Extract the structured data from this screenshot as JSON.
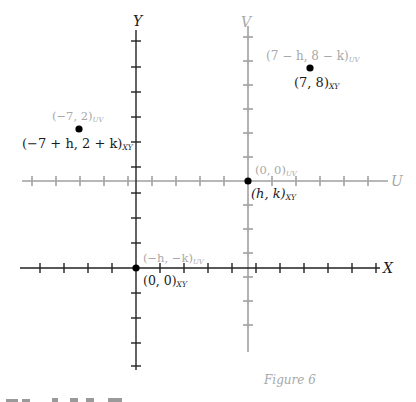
{
  "figure": {
    "caption": "Figure 6",
    "colors": {
      "xy_axes": "#222222",
      "uv_axes": "#a0a0a0",
      "xy_labels": "#1a1a1a",
      "uv_labels": "#a8a8a8",
      "points": "#000000"
    }
  },
  "axes": {
    "xy": {
      "x_label": "X",
      "y_label": "Y"
    },
    "uv": {
      "u_label": "U",
      "v_label": "V"
    }
  },
  "points": [
    {
      "id": "origin-xy",
      "xy_main": "(0, 0)",
      "xy_sub": "XY",
      "uv_main": "(−h, −k)",
      "uv_sub": "UV"
    },
    {
      "id": "origin-uv",
      "xy_main": "(h, k)",
      "xy_sub": "XY",
      "uv_main": "(0, 0)",
      "uv_sub": "UV"
    },
    {
      "id": "point-7-8",
      "xy_main": "(7, 8)",
      "xy_sub": "XY",
      "uv_main": "(7 − h, 8 − k)",
      "uv_sub": "UV"
    },
    {
      "id": "point-neg7-2",
      "xy_main": "(−7 + h, 2 + k)",
      "xy_sub": "XY",
      "uv_main": "(−7, 2)",
      "uv_sub": "UV"
    }
  ],
  "footer": {
    "partial_text": "Figure 6"
  }
}
